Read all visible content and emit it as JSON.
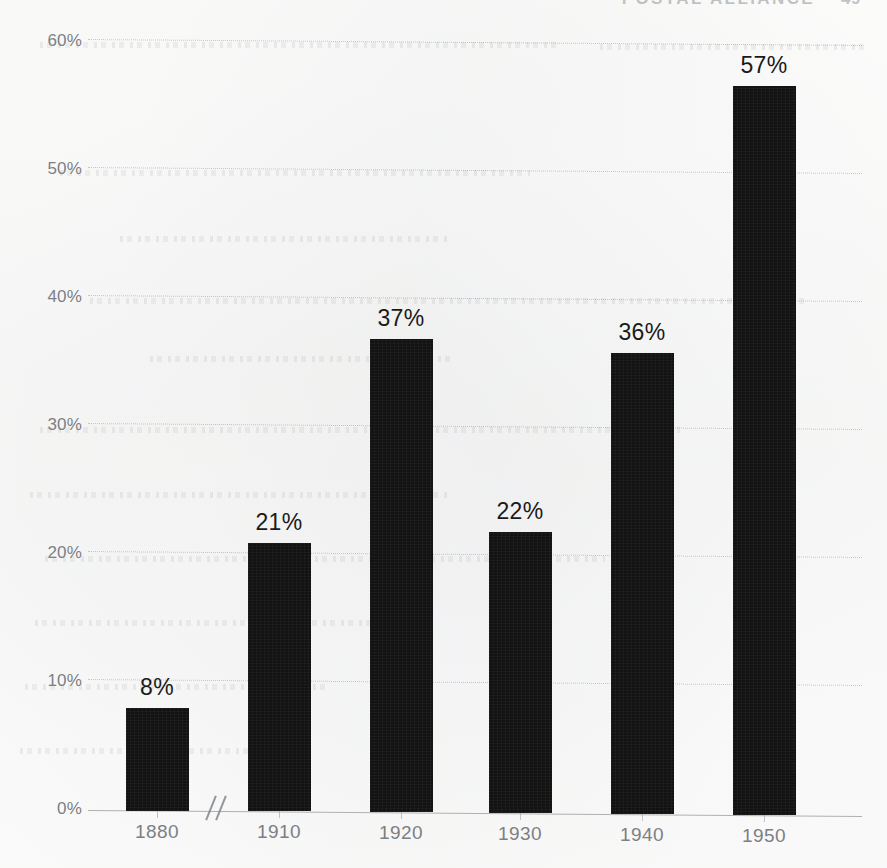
{
  "page": {
    "header_text": "POSTAL ALLIANCE",
    "page_number": "49"
  },
  "chart_data": {
    "type": "bar",
    "title": "",
    "subtitle": "",
    "xlabel": "",
    "ylabel": "",
    "categories": [
      "1880",
      "1910",
      "1920",
      "1930",
      "1940",
      "1950"
    ],
    "values": [
      8,
      21,
      37,
      22,
      36,
      57
    ],
    "data_labels": [
      "8%",
      "21%",
      "37%",
      "22%",
      "36%",
      "57%"
    ],
    "ylim": [
      0,
      60
    ],
    "yticks": [
      0,
      10,
      20,
      30,
      40,
      50,
      60
    ],
    "ytick_labels": [
      "0%",
      "10%",
      "20%",
      "30%",
      "40%",
      "50%",
      "60%"
    ],
    "grid": true,
    "gridline_style": "dotted",
    "legend": "none",
    "axis_break_after_category": "1880",
    "axis_break_symbol": "//",
    "bar_color": "#121212",
    "grid_color": "#787c84",
    "tick_label_color": "#7d7f85"
  }
}
